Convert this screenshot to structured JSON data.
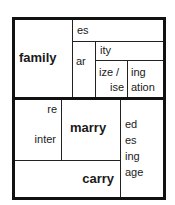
{
  "diagram": {
    "top_section": {
      "base_word": "family",
      "suffixes": {
        "es": "es",
        "ar": "ar",
        "ity": "ity",
        "ize_ise_line1": "ize /",
        "ize_ise_line2": "ise",
        "ing_line1": "ing",
        "ing_line2": "ation"
      }
    },
    "bottom_section": {
      "prefixes": {
        "re": "re",
        "inter": "inter"
      },
      "base_word_1": "marry",
      "base_word_2": "carry",
      "suffixes": {
        "ed": "ed",
        "es": "es",
        "ing": "ing",
        "age": "age"
      }
    }
  }
}
